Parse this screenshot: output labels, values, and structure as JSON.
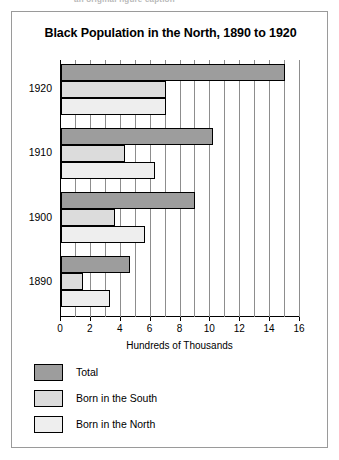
{
  "page": {
    "top_cut_text": "an original figure caption"
  },
  "figure": {
    "title": "Black Population in the North, 1890 to 1920"
  },
  "chart_data": {
    "type": "bar",
    "orientation": "horizontal",
    "title": "Black Population in the North, 1890 to 1920",
    "xlabel": "Hundreds of Thousands",
    "ylabel": "",
    "xlim": [
      0,
      16
    ],
    "xticks": [
      0,
      2,
      4,
      6,
      8,
      10,
      12,
      14,
      16
    ],
    "xtick_labels": [
      "0",
      "2",
      "4",
      "6",
      "8",
      "10",
      "12",
      "14",
      "16"
    ],
    "minor_gridlines_every": 1,
    "grid": true,
    "legend_position": "below-left",
    "categories": [
      "1920",
      "1910",
      "1900",
      "1890"
    ],
    "series": [
      {
        "name": "Total",
        "color": "#9d9d9d",
        "values": [
          15.0,
          10.2,
          9.0,
          4.6
        ]
      },
      {
        "name": "Born in the South",
        "color": "#dcdcdc",
        "values": [
          7.0,
          4.3,
          3.6,
          1.5
        ]
      },
      {
        "name": "Born in the North",
        "color": "#eeeeee",
        "values": [
          7.0,
          6.3,
          5.6,
          3.3
        ]
      }
    ]
  },
  "legend": {
    "items": [
      {
        "label": "Total",
        "swatch": "total"
      },
      {
        "label": "Born in the South",
        "swatch": "south"
      },
      {
        "label": "Born in the North",
        "swatch": "north"
      }
    ]
  }
}
